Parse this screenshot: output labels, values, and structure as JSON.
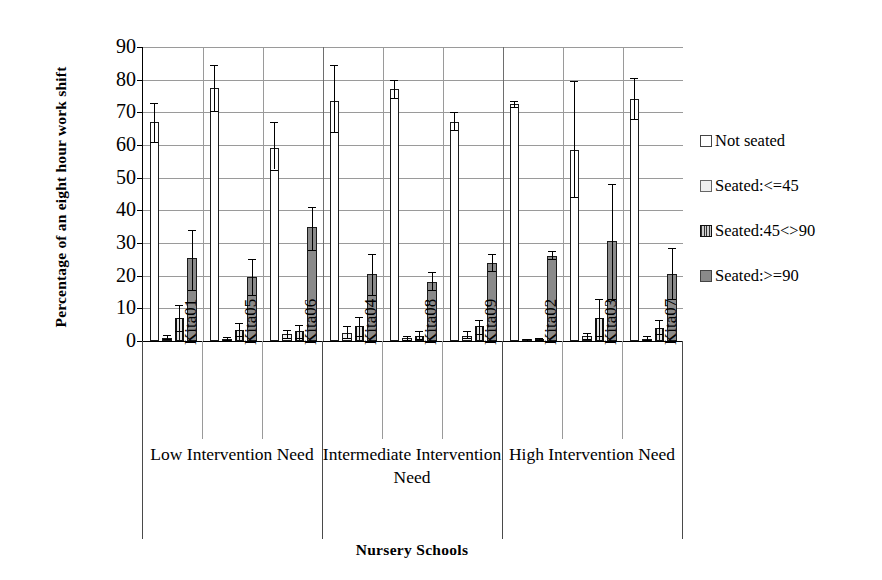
{
  "chart_data": {
    "type": "bar",
    "title": "",
    "xlabel": "Nursery Schools",
    "ylabel": "Percentage of an eight hour work shift",
    "ylim": [
      0,
      90
    ],
    "yticks": [
      0,
      10,
      20,
      30,
      40,
      50,
      60,
      70,
      80,
      90
    ],
    "grid": true,
    "legend_position": "right",
    "categories": [
      "Kita01",
      "Kita05",
      "Kita06",
      "Kita04",
      "Kita08",
      "Kita09",
      "Kita02",
      "Kita03",
      "Kita07"
    ],
    "groups": [
      {
        "label": "Low Intervention Need",
        "categories": [
          "Kita01",
          "Kita05",
          "Kita06"
        ]
      },
      {
        "label": "Intermediate Intervention Need",
        "categories": [
          "Kita04",
          "Kita08",
          "Kita09"
        ]
      },
      {
        "label": "High Intervention Need",
        "categories": [
          "Kita02",
          "Kita03",
          "Kita07"
        ]
      }
    ],
    "series": [
      {
        "name": "Not seated",
        "color": "#ffffff",
        "values": [
          67,
          77.5,
          59,
          73.5,
          77,
          67,
          72.5,
          58.5,
          74
        ],
        "err_low": [
          61,
          70.5,
          52.5,
          64,
          74.5,
          64.5,
          71.5,
          44,
          68
        ],
        "err_high": [
          73,
          84.5,
          67,
          84.5,
          80,
          70,
          73.5,
          79.5,
          80.5
        ]
      },
      {
        "name": "Seated:<=45",
        "color": "#f0f0f0",
        "values": [
          1,
          0.5,
          2,
          2.5,
          0.8,
          1.5,
          0.3,
          1.5,
          0.7
        ],
        "err_low": [
          0.5,
          0.2,
          0.8,
          1,
          0.3,
          0.8,
          0.1,
          0.5,
          0.3
        ],
        "err_high": [
          1.8,
          1.2,
          3.5,
          4.5,
          1.5,
          3,
          0.6,
          2.5,
          1.4
        ]
      },
      {
        "name": "Seated:45<>90",
        "color": "#cfcfcf",
        "values": [
          7,
          3.5,
          3,
          4.5,
          1.5,
          4.5,
          0.5,
          7,
          4
        ],
        "err_low": [
          3,
          1.5,
          1,
          1.5,
          0.5,
          2,
          0.2,
          1.5,
          2
        ],
        "err_high": [
          11,
          5.5,
          5,
          7.5,
          3,
          6.5,
          1,
          13,
          6.5
        ]
      },
      {
        "name": "Seated:>=90",
        "color": "#8a8a8a",
        "values": [
          25.5,
          19.5,
          35,
          20.5,
          18,
          24,
          26,
          30.5,
          20.5
        ],
        "err_low": [
          15.5,
          14,
          28,
          14,
          15.5,
          21.5,
          25,
          13,
          13
        ],
        "err_high": [
          34,
          25,
          41,
          26.5,
          21,
          26.5,
          27.5,
          48,
          28.5
        ]
      }
    ]
  },
  "legend": {
    "items": [
      {
        "label": "Not seated",
        "swatch": "series-0-swatch"
      },
      {
        "label": "Seated:<=45",
        "swatch": "series-1-swatch"
      },
      {
        "label": "Seated:45<>90",
        "swatch": "series-2-swatch"
      },
      {
        "label": "Seated:>=90",
        "swatch": "series-3-swatch"
      }
    ]
  }
}
